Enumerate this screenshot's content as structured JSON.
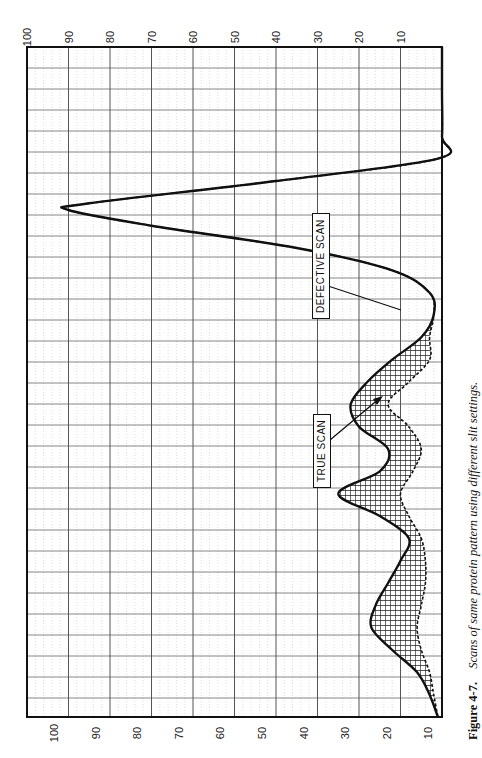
{
  "caption": {
    "number": "Figure 4-7.",
    "text": "Scans of same protein pattern using different slit settings."
  },
  "labels": {
    "true_scan": "TRUE SCAN",
    "defective_scan": "DEFECTIVE SCAN"
  },
  "axis": {
    "ticks_top": [
      "100",
      "90",
      "80",
      "70",
      "60",
      "50",
      "40",
      "30",
      "20",
      "10"
    ],
    "ticks_bottom": [
      "100",
      "90",
      "80",
      "70",
      "60",
      "50",
      "40",
      "30",
      "20",
      "10"
    ]
  },
  "colors": {
    "grid_major": "#555555",
    "grid_minor": "#bbbbbb",
    "trace": "#111111",
    "fill_hatch": "#222222",
    "background": "#ffffff"
  },
  "chart_data": {
    "type": "line",
    "orientation": "rotated 90° (value axis horizontal, 100 at left → 0 at right; scan position runs top→bottom)",
    "title": "Scans of same protein pattern using different slit settings",
    "xlabel": "Position along scan (top → bottom)",
    "ylabel": "Absorbance / % scale",
    "ylim": [
      0,
      100
    ],
    "grid": true,
    "x": [
      0,
      10,
      20,
      25,
      30,
      35,
      36.5,
      40,
      45,
      50,
      55,
      60,
      65,
      70,
      75,
      80,
      85,
      90,
      95,
      100,
      105,
      110,
      115,
      120,
      125,
      130,
      135,
      140,
      145,
      150
    ],
    "series": [
      {
        "name": "TRUE SCAN",
        "values": [
          0,
          0,
          0,
          1,
          40,
          85,
          90,
          70,
          35,
          12,
          3,
          2,
          5,
          12,
          18,
          22,
          20,
          13,
          15,
          25,
          15,
          8,
          10,
          13,
          16,
          17,
          12,
          6,
          3,
          1
        ]
      },
      {
        "name": "DEFECTIVE SCAN",
        "values": [
          0,
          0,
          0,
          1,
          40,
          85,
          90,
          70,
          35,
          12,
          3,
          2,
          3,
          3,
          8,
          13,
          8,
          5,
          7,
          10,
          8,
          5,
          4,
          4,
          5,
          6,
          5,
          3,
          2,
          1
        ]
      }
    ],
    "annotations": [
      {
        "text": "TRUE SCAN",
        "points_to": "secondary peak ~25 near position 100"
      },
      {
        "text": "DEFECTIVE SCAN",
        "points_to": "inner curve near position 80"
      }
    ],
    "shaded_region": "area between TRUE SCAN and DEFECTIVE SCAN is cross-hatched"
  }
}
